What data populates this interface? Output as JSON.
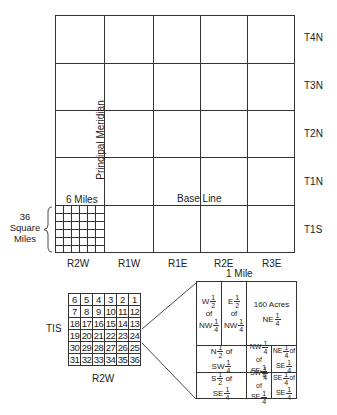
{
  "main_grid": {
    "township_labels": [
      "T4N",
      "T3N",
      "T2N",
      "T1N",
      "T1S"
    ],
    "range_labels": [
      "R2W",
      "R1W",
      "R1E",
      "R2E",
      "R3E"
    ],
    "principal_meridian_label": "Principal Meridian",
    "base_line_label": "Base Line",
    "six_miles_label": "6 Miles",
    "area_label_lines": [
      "36",
      "Square",
      "Miles"
    ]
  },
  "township_detail": {
    "row_label": "TIS",
    "column_label": "R2W",
    "sections": [
      [
        "6",
        "5",
        "4",
        "3",
        "2",
        "1"
      ],
      [
        "7",
        "8",
        "9",
        "10",
        "11",
        "12"
      ],
      [
        "18",
        "17",
        "16",
        "15",
        "14",
        "13"
      ],
      [
        "19",
        "20",
        "21",
        "22",
        "23",
        "24"
      ],
      [
        "30",
        "29",
        "28",
        "27",
        "26",
        "25"
      ],
      [
        "31",
        "32",
        "33",
        "34",
        "35",
        "36"
      ]
    ]
  },
  "section_detail": {
    "scale_label": "1 Mile",
    "parcels": {
      "w_half_nw": {
        "pre": "W",
        "num": "1",
        "den": "2",
        "mid": "of",
        "post": "NW",
        "num2": "1",
        "den2": "4"
      },
      "e_half_nw": {
        "pre": "E",
        "num": "1",
        "den": "2",
        "mid": "of",
        "post": "NW",
        "num2": "1",
        "den2": "4"
      },
      "ne_quarter": {
        "top": "160 Acres",
        "pre": "NE",
        "num": "1",
        "den": "4"
      },
      "n_half_sw": {
        "pre": "N",
        "num": "1",
        "den": "2",
        "mid": "of",
        "post": "SW",
        "num2": "1",
        "den2": "4"
      },
      "nw_se": {
        "pre": "NW",
        "num": "1",
        "den": "4",
        "mid": "of",
        "post": "SE",
        "num2": "1",
        "den2": "4"
      },
      "ne_se": {
        "pre": "NE",
        "num": "1",
        "den": "4",
        "mid": "of",
        "post": "SE",
        "num2": "1",
        "den2": "4"
      },
      "s_half_se": {
        "pre": "S",
        "num": "1",
        "den": "2",
        "mid": "of",
        "post": "SE",
        "num2": "1",
        "den2": "4"
      },
      "sw_se": {
        "pre": "SW",
        "num": "1",
        "den": "4",
        "mid": "of",
        "post": "SE",
        "num2": "1",
        "den2": "4"
      },
      "se_se": {
        "pre": "SE",
        "num": "1",
        "den": "4",
        "mid": "of",
        "post": "SE",
        "num2": "1",
        "den2": "4"
      }
    }
  }
}
